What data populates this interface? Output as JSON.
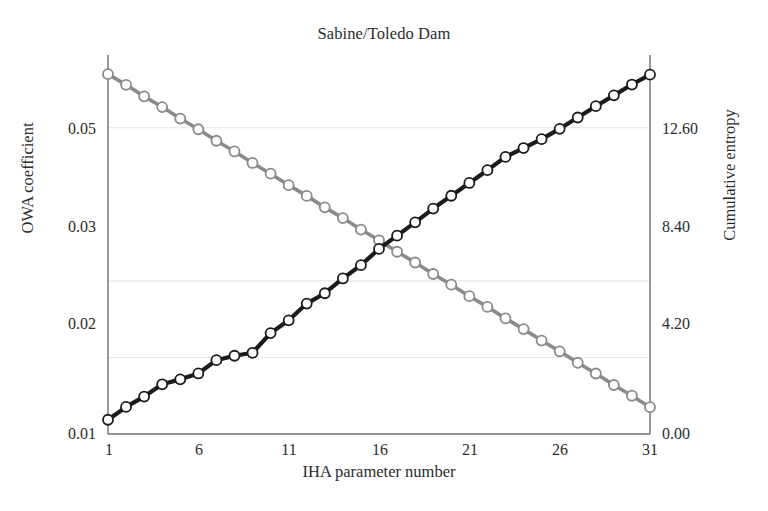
{
  "chart_data": {
    "type": "line",
    "title": "Sabine/Toledo Dam",
    "xlabel": "IHA parameter number",
    "ylabel": "OWA coefficient",
    "ylabel_right": "Cumulative entropy",
    "grid": true,
    "legend": "none",
    "xlim": [
      1,
      31
    ],
    "xticks": [
      1,
      6,
      11,
      16,
      21,
      26,
      31
    ],
    "xtick_labels": [
      "1",
      "6",
      "11",
      "16",
      "21",
      "26",
      "31"
    ],
    "ylim": [
      0.01,
      0.0595
    ],
    "yticks": [
      0.01,
      0.02,
      0.03,
      0.05
    ],
    "ytick_labels": [
      "0.01",
      "0.02",
      "0.03",
      "0.05"
    ],
    "ylim_right": [
      0.0,
      15.4
    ],
    "yticks_right": [
      0.0,
      4.2,
      8.4,
      12.6
    ],
    "ytick_labels_right": [
      "0.00",
      "4.20",
      "8.40",
      "12.60"
    ],
    "x": [
      1,
      2,
      3,
      4,
      5,
      6,
      7,
      8,
      9,
      10,
      11,
      12,
      13,
      14,
      15,
      16,
      17,
      18,
      19,
      20,
      21,
      22,
      23,
      24,
      25,
      26,
      27,
      28,
      29,
      30,
      31
    ],
    "series": [
      {
        "name": "OWA coefficient",
        "axis": "left",
        "color": "#8a8a8a",
        "marker": "open-circle",
        "values": [
          0.057,
          0.0556,
          0.0541,
          0.0527,
          0.0512,
          0.0498,
          0.0483,
          0.0469,
          0.0454,
          0.044,
          0.0425,
          0.0411,
          0.0396,
          0.0382,
          0.0367,
          0.0353,
          0.0338,
          0.0324,
          0.0309,
          0.0295,
          0.028,
          0.0266,
          0.0251,
          0.0237,
          0.0222,
          0.0208,
          0.0193,
          0.0179,
          0.0164,
          0.015,
          0.0135
        ]
      },
      {
        "name": "Cumulative entropy",
        "axis": "right",
        "color": "#1b1b1b",
        "marker": "open-circle",
        "values": [
          0.58,
          1.1,
          1.52,
          2.02,
          2.22,
          2.46,
          3.0,
          3.18,
          3.3,
          4.1,
          4.62,
          5.3,
          5.72,
          6.32,
          6.86,
          7.52,
          8.06,
          8.6,
          9.16,
          9.68,
          10.2,
          10.72,
          11.26,
          11.62,
          11.98,
          12.4,
          12.86,
          13.32,
          13.76,
          14.2,
          14.6
        ]
      }
    ]
  }
}
